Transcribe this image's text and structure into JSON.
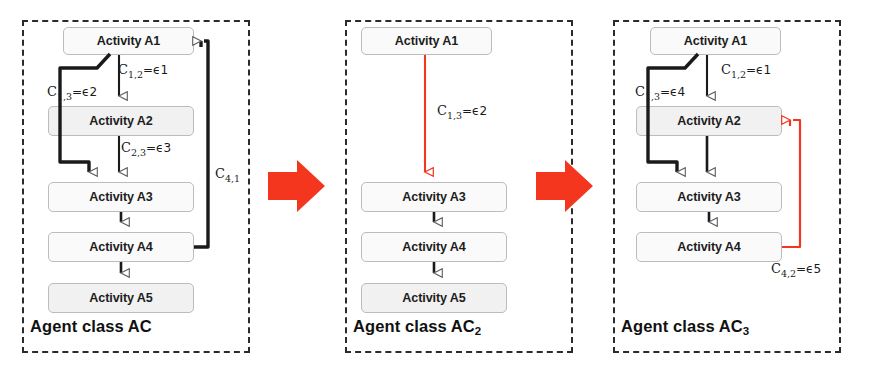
{
  "figure": {
    "type": "diagram",
    "colors": {
      "red_accent": "#f4361f",
      "node_border": "#b9bcc0",
      "node_fill": "#fafafa",
      "node_fill_shaded": "#f1f1f1",
      "panel_border": "#2b2b2b",
      "edge_black": "#1a1a1a"
    }
  },
  "panels": [
    {
      "id": "panel-ac",
      "label_main": "Agent class AC",
      "label_sub": "",
      "nodes": [
        {
          "id": "a1",
          "label": "Activity A1",
          "shaded": false
        },
        {
          "id": "a2",
          "label": "Activity A2",
          "shaded": true
        },
        {
          "id": "a3",
          "label": "Activity A3",
          "shaded": false
        },
        {
          "id": "a4",
          "label": "Activity A4",
          "shaded": false
        },
        {
          "id": "a5",
          "label": "Activity A5",
          "shaded": true
        }
      ],
      "edges": [
        {
          "id": "e12",
          "from": "a1",
          "to": "a2",
          "color": "black",
          "label_c": "C",
          "label_sub": "1,2",
          "label_val": "=ϵ1"
        },
        {
          "id": "e13",
          "from": "a1",
          "to": "a3",
          "color": "black",
          "label_c": "C",
          "label_sub": "1,3",
          "label_val": "=ϵ2"
        },
        {
          "id": "e23",
          "from": "a2",
          "to": "a3",
          "color": "black",
          "label_c": "C",
          "label_sub": "2,3",
          "label_val": "=ϵ3"
        },
        {
          "id": "e34",
          "from": "a3",
          "to": "a4",
          "color": "black",
          "label_c": "",
          "label_sub": "",
          "label_val": ""
        },
        {
          "id": "e45",
          "from": "a4",
          "to": "a5",
          "color": "black",
          "label_c": "",
          "label_sub": "",
          "label_val": ""
        },
        {
          "id": "e41",
          "from": "a4",
          "to": "a1",
          "color": "black",
          "label_c": "C",
          "label_sub": "4,1",
          "label_val": ""
        }
      ]
    },
    {
      "id": "panel-ac2",
      "label_main": "Agent class AC",
      "label_sub": "2",
      "nodes": [
        {
          "id": "a1",
          "label": "Activity A1",
          "shaded": false
        },
        {
          "id": "a3",
          "label": "Activity A3",
          "shaded": false
        },
        {
          "id": "a4",
          "label": "Activity A4",
          "shaded": false
        },
        {
          "id": "a5",
          "label": "Activity A5",
          "shaded": true
        }
      ],
      "edges": [
        {
          "id": "e13",
          "from": "a1",
          "to": "a3",
          "color": "red",
          "label_c": "C",
          "label_sub": "1,3",
          "label_val": "=ϵ2"
        },
        {
          "id": "e34",
          "from": "a3",
          "to": "a4",
          "color": "black",
          "label_c": "",
          "label_sub": "",
          "label_val": ""
        },
        {
          "id": "e45",
          "from": "a4",
          "to": "a5",
          "color": "black",
          "label_c": "",
          "label_sub": "",
          "label_val": ""
        }
      ]
    },
    {
      "id": "panel-ac3",
      "label_main": "Agent class AC",
      "label_sub": "3",
      "nodes": [
        {
          "id": "a1",
          "label": "Activity A1",
          "shaded": false
        },
        {
          "id": "a2",
          "label": "Activity A2",
          "shaded": true
        },
        {
          "id": "a3",
          "label": "Activity A3",
          "shaded": false
        },
        {
          "id": "a4",
          "label": "Activity A4",
          "shaded": false
        }
      ],
      "edges": [
        {
          "id": "e12",
          "from": "a1",
          "to": "a2",
          "color": "black",
          "label_c": "C",
          "label_sub": "1,2",
          "label_val": "=ϵ1"
        },
        {
          "id": "e13",
          "from": "a1",
          "to": "a3",
          "color": "black",
          "label_c": "C",
          "label_sub": "1,3",
          "label_val": "=ϵ4"
        },
        {
          "id": "e23",
          "from": "a2",
          "to": "a3",
          "color": "black",
          "label_c": "",
          "label_sub": "",
          "label_val": ""
        },
        {
          "id": "e34",
          "from": "a3",
          "to": "a4",
          "color": "black",
          "label_c": "",
          "label_sub": "",
          "label_val": ""
        },
        {
          "id": "e42",
          "from": "a4",
          "to": "a2",
          "color": "red",
          "label_c": "C",
          "label_sub": "4,2",
          "label_val": "=ϵ5"
        }
      ]
    }
  ],
  "transitions": [
    {
      "id": "transition-1",
      "name": "red-right-arrow"
    },
    {
      "id": "transition-2",
      "name": "red-right-arrow"
    }
  ]
}
